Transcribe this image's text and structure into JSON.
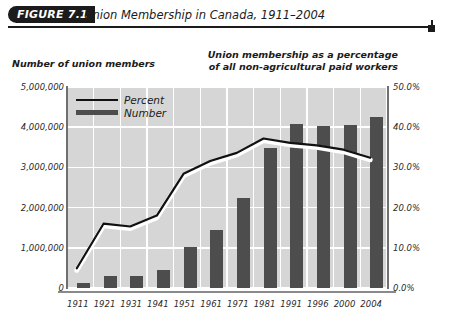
{
  "figure": {
    "tag": "FIGURE 7.1",
    "title": "Union Membership in Canada, 1911–2004",
    "left_axis_caption": "Number of union members",
    "right_axis_caption_line1": "Union membership as a percentage",
    "right_axis_caption_line2": "of all non-agricultural paid workers"
  },
  "legend": {
    "percent_label": "Percent",
    "number_label": "Number"
  },
  "colors": {
    "bar": "#4d4d4d",
    "line": "#111111",
    "line_halo": "#ffffff",
    "plot_background": "#d6d6d6",
    "gridline": "#ffffff",
    "tag_background": "#1b1b1b",
    "text": "#1b1b1b"
  },
  "chart_data": {
    "type": "bar",
    "title": "Union Membership in Canada, 1911–2004",
    "subtitle": "",
    "xlabel": "",
    "ylabel": "Number of union members",
    "y2label": "Union membership as a percentage of all non-agricultural paid workers",
    "categories": [
      "1911",
      "1921",
      "1931",
      "1941",
      "1951",
      "1961",
      "1971",
      "1981",
      "1991",
      "1996",
      "2000",
      "2004"
    ],
    "ylim": [
      0,
      5000000
    ],
    "y2lim": [
      0,
      0.5
    ],
    "ytick_labels": [
      "0",
      "1,000,000",
      "2,000,000",
      "3,000,000",
      "4,000,000",
      "5,000,000"
    ],
    "ytick_values": [
      0,
      1000000,
      2000000,
      3000000,
      4000000,
      5000000
    ],
    "y2tick_labels": [
      "0.0%",
      "10.0%",
      "20.0%",
      "30.0%",
      "40.0%",
      "50.0%"
    ],
    "y2tick_values": [
      0,
      10,
      20,
      30,
      40,
      50
    ],
    "grid": true,
    "legend_position": "upper-left",
    "series": [
      {
        "name": "Number",
        "type": "bar",
        "axis": "left",
        "values": [
          130000,
          310000,
          310000,
          460000,
          1030000,
          1450000,
          2230000,
          3490000,
          4070000,
          4030000,
          4060000,
          4260000
        ]
      },
      {
        "name": "Percent",
        "type": "line",
        "axis": "right",
        "values": [
          4.9,
          16.0,
          15.3,
          18.0,
          28.4,
          31.6,
          33.6,
          37.2,
          36.1,
          35.5,
          34.4,
          32.4
        ]
      }
    ]
  }
}
